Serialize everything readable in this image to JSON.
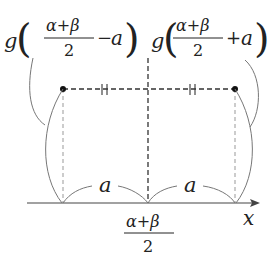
{
  "diagram": {
    "left_label": {
      "func": "g",
      "numerator": "α+β",
      "denominator": "2",
      "op": "−",
      "var": "a"
    },
    "right_label": {
      "func": "g",
      "numerator": "α+β",
      "denominator": "2",
      "op": "+",
      "var": "a"
    },
    "center_label": {
      "numerator": "α+β",
      "denominator": "2"
    },
    "axis_label": "x",
    "left_distance_label": "a",
    "right_distance_label": "a",
    "colors": {
      "line": "#333333",
      "curve": "#777777",
      "dashed": "#444444",
      "thin_dashed": "#999999"
    }
  }
}
